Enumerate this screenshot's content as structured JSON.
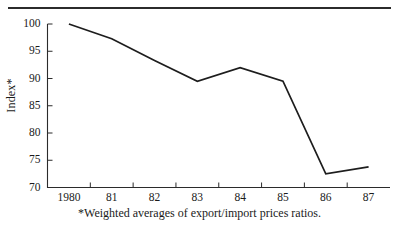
{
  "figure": {
    "ylabel": "Index*",
    "footnote": "*Weighted averages of export/import prices ratios."
  },
  "chart_data": {
    "type": "line",
    "title": "",
    "xlabel": "",
    "ylabel": "Index*",
    "categories": [
      "1980",
      "81",
      "82",
      "83",
      "84",
      "85",
      "86",
      "87"
    ],
    "x": [
      1980,
      1981,
      1982,
      1983,
      1984,
      1985,
      1986,
      1987
    ],
    "values": [
      100.0,
      97.3,
      93.3,
      89.5,
      92.0,
      89.5,
      72.5,
      73.8
    ],
    "series": [
      {
        "name": "Index*",
        "values": [
          100.0,
          97.3,
          93.3,
          89.5,
          92.0,
          89.5,
          72.5,
          73.8
        ]
      }
    ],
    "ylim": [
      70,
      100
    ],
    "yticks": [
      70,
      75,
      80,
      85,
      90,
      95,
      100
    ],
    "ytick_labels": [
      "70",
      "75",
      "80",
      "85",
      "90",
      "95",
      "100"
    ],
    "xtick_labels": [
      "1980",
      "81",
      "82",
      "83",
      "84",
      "85",
      "86",
      "87"
    ],
    "grid": false,
    "legend": null,
    "annotations": [
      "*Weighted averages of export/import prices ratios."
    ],
    "line_color": "#1d1d1d"
  }
}
